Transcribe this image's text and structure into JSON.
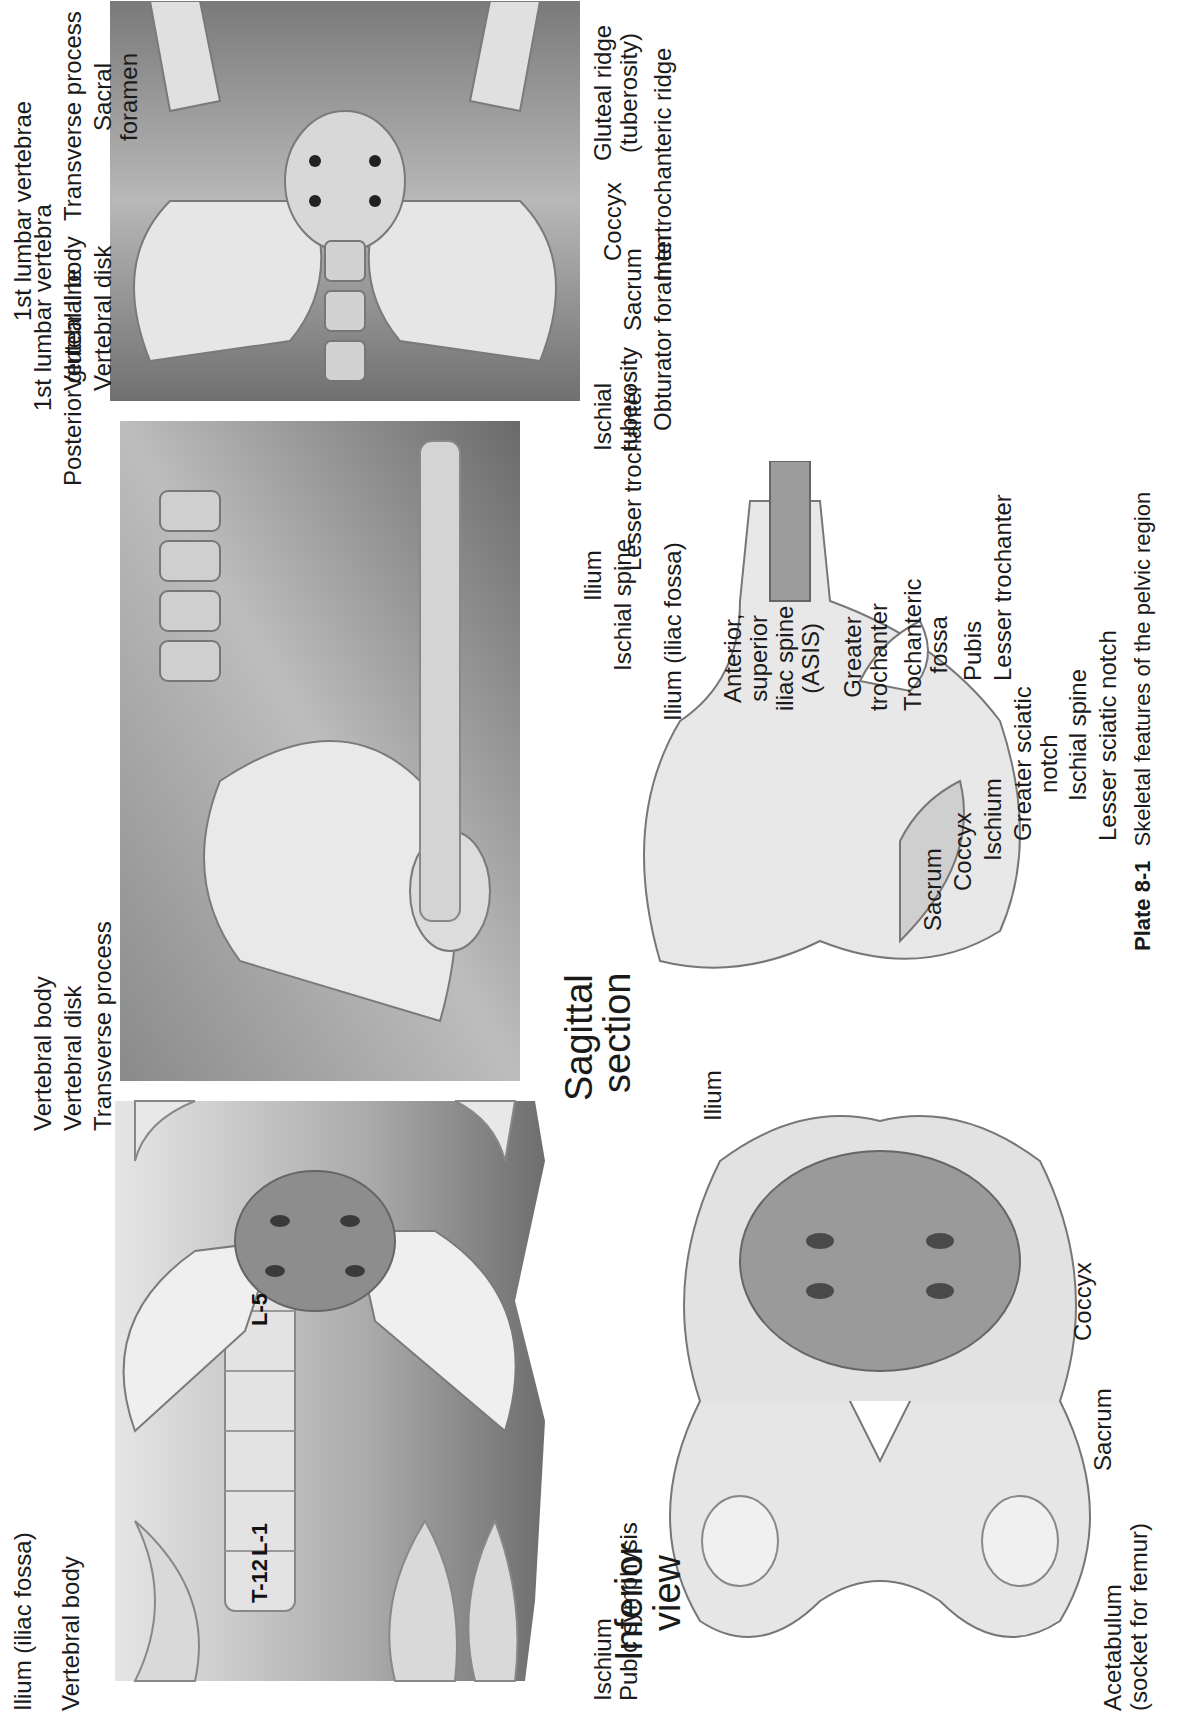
{
  "page": {
    "orientation": "rotated-90-ccw",
    "caption": {
      "plate": "Plate 8-1",
      "text": "Skeletal features of the pelvic region"
    }
  },
  "anterior_view": {
    "vertebra_tags": [
      "T-12",
      "L-1",
      "L-5"
    ],
    "labels": {
      "vertebral_body": "Vertebral body",
      "vertebral_disk": "Vertebral disk",
      "transverse_process": "Transverse process",
      "posterior_gluteal_line": "Posterior gluteal line",
      "ilium": "Ilium (iliac fossa)",
      "psis": "Posterior, superior iliac spine (PSIS)",
      "asis_l1": "Anterior,",
      "asis_l2": "superior",
      "asis_l3": "iliac spine",
      "asis_l4": "(ASIS)",
      "sacrum": "Sacrum",
      "coccyx": "Coccyx",
      "iliopubic_l1": "Iliopubic",
      "iliopubic_l2": "eminence",
      "greater_troch_l1": "Greater",
      "greater_troch_l2": "trochanter",
      "lesser_troch_l1": "Lesser",
      "lesser_troch_l2": "trochanter",
      "femur": "Femur",
      "obturator_foramen": "Obturator foramen",
      "pubis": "Pubis",
      "pubic_symphysis": "Pubic symphysis",
      "ischium": "Ischium"
    }
  },
  "lateral_view": {
    "labels": {
      "rib_l1": "12th",
      "rib_l2": "rib",
      "first_lumbar": "1st lumbar vertebra",
      "vertebral_body": "Vertebral body",
      "vertebral_disk": "Vertebral disk",
      "anterior_gluteal": "Anterior gluteal line",
      "inferior_gluteal": "Inferior gluteal line",
      "asis_l1": "Anterior,",
      "asis_l2": "superior",
      "asis_l3": "iliac spine",
      "asis_l4": "(ASIS)",
      "pubis": "Pubis"
    }
  },
  "posterior_view": {
    "labels": {
      "first_lumbar": "1st lumbar vertebrae",
      "transverse_process": "Transverse process",
      "sacral_l1": "Sacral",
      "sacral_l2": "foramen",
      "gluteal_l1": "Gluteal ridge",
      "gluteal_l2": "(tuberosity)",
      "intertrochanteric": "Intertrochanteric ridge",
      "coccyx": "Coccyx",
      "sacrum": "Sacrum",
      "obturator_foramen": "Obturator foramen",
      "ischial_tub_l1": "Ischial",
      "ischial_tub_l2": "tuberosity",
      "lesser_trochanter": "Lesser trochanter",
      "ilium": "Ilium",
      "ischial_spine": "Ischial spine"
    }
  },
  "sagittal_section": {
    "title_l1": "Sagittal",
    "title_l2": "section",
    "labels": {
      "ilium": "Ilium (iliac fossa)",
      "asis_l1": "Anterior,",
      "asis_l2": "superior",
      "asis_l3": "iliac spine",
      "asis_l4": "(ASIS)",
      "greater_troch_l1": "Greater",
      "greater_troch_l2": "trochanter",
      "troch_fossa_l1": "Trochanteric",
      "troch_fossa_l2": "fossa",
      "pubis": "Pubis",
      "lesser_trochanter": "Lesser trochanter",
      "sacrum": "Sacrum",
      "coccyx": "Coccyx",
      "ischium": "Ischium",
      "greater_sciatic_l1": "Greater sciatic",
      "greater_sciatic_l2": "notch",
      "ischial_spine": "Ischial spine",
      "lesser_sciatic": "Lesser sciatic notch"
    }
  },
  "inferior_view": {
    "title_l1": "Inferior",
    "title_l2": "view",
    "labels": {
      "ilium": "Ilium",
      "coccyx": "Coccyx",
      "sacrum": "Sacrum",
      "acetabulum_l1": "Acetabulum",
      "acetabulum_l2": "(socket for femur)"
    }
  }
}
